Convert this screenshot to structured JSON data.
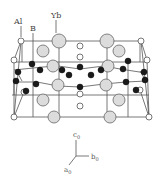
{
  "figure": {
    "labels": {
      "al": {
        "text": "Al",
        "x": 14,
        "y": 24
      },
      "b": {
        "text": "B",
        "x": 30,
        "y": 31
      },
      "yb": {
        "text": "Yb",
        "x": 51,
        "y": 18
      }
    },
    "leaders": [
      {
        "x1": 21,
        "y1": 26,
        "x2": 21,
        "y2": 37
      },
      {
        "x1": 33,
        "y1": 33,
        "x2": 33,
        "y2": 60
      },
      {
        "x1": 56,
        "y1": 20,
        "x2": 56,
        "y2": 33
      }
    ],
    "axes": {
      "origin": [
        76,
        156
      ],
      "c": {
        "label": "c",
        "sub": "0",
        "end": [
          76,
          140
        ],
        "lx": 73,
        "ly": 137
      },
      "b": {
        "label": "b",
        "sub": "0",
        "end": [
          89,
          156
        ],
        "lx": 91,
        "ly": 159
      },
      "a": {
        "label": "a",
        "sub": "0",
        "end": [
          69,
          165
        ],
        "lx": 64,
        "ly": 172
      }
    },
    "colors": {
      "line": "#555555",
      "yb_fill": "#dcdcdc",
      "yb_stroke": "#666666",
      "b_fill": "#1a1a1a",
      "al_fill": "#ffffff",
      "al_stroke": "#555555"
    }
  },
  "chart_data": {
    "type": "diagram",
    "legend": [
      "Al",
      "B",
      "Yb"
    ],
    "frame_lines": [
      [
        21,
        41,
        141,
        41
      ],
      [
        14,
        117,
        149,
        117
      ],
      [
        21,
        41,
        14,
        117
      ],
      [
        141,
        41,
        149,
        117
      ],
      [
        21,
        41,
        14,
        60
      ],
      [
        141,
        41,
        147,
        60
      ],
      [
        14,
        60,
        14,
        117
      ],
      [
        147,
        60,
        149,
        117
      ],
      [
        12,
        62,
        149,
        62
      ],
      [
        12,
        95,
        149,
        95
      ],
      [
        22,
        40,
        22,
        62
      ],
      [
        140,
        40,
        140,
        62
      ],
      [
        59,
        41,
        59,
        117
      ],
      [
        107,
        41,
        107,
        117
      ],
      [
        33,
        60,
        33,
        117
      ],
      [
        128,
        60,
        128,
        117
      ],
      [
        14,
        80,
        14,
        95
      ],
      [
        14,
        70,
        43,
        67
      ],
      [
        43,
        67,
        58,
        66
      ],
      [
        58,
        66,
        80,
        69
      ],
      [
        80,
        69,
        104,
        66
      ],
      [
        104,
        66,
        120,
        69
      ],
      [
        120,
        69,
        146,
        73
      ],
      [
        14,
        82,
        37,
        82
      ],
      [
        37,
        82,
        58,
        86
      ],
      [
        58,
        86,
        80,
        87
      ],
      [
        80,
        87,
        104,
        84
      ],
      [
        104,
        84,
        126,
        82
      ],
      [
        126,
        82,
        146,
        81
      ],
      [
        16,
        70,
        22,
        81
      ],
      [
        140,
        71,
        146,
        81
      ],
      [
        24,
        92,
        14,
        117
      ],
      [
        140,
        90,
        149,
        117
      ]
    ],
    "yb_atoms": [
      [
        59,
        41,
        7
      ],
      [
        107,
        41,
        7
      ],
      [
        43,
        51,
        6
      ],
      [
        119,
        51,
        6
      ],
      [
        53,
        66,
        6
      ],
      [
        108,
        66,
        6
      ],
      [
        58,
        85,
        6
      ],
      [
        106,
        85,
        6
      ],
      [
        43,
        100,
        6
      ],
      [
        119,
        100,
        6
      ],
      [
        54,
        117,
        6
      ],
      [
        110,
        117,
        6
      ]
    ],
    "b_atoms": [
      [
        32,
        64,
        3
      ],
      [
        40,
        70,
        3
      ],
      [
        18,
        72,
        3
      ],
      [
        62,
        70,
        3
      ],
      [
        69,
        75,
        3
      ],
      [
        80,
        67,
        3
      ],
      [
        91,
        75,
        3
      ],
      [
        101,
        70,
        3
      ],
      [
        123,
        69,
        3
      ],
      [
        128,
        61,
        3
      ],
      [
        144,
        72,
        3
      ],
      [
        16,
        81,
        3
      ],
      [
        36,
        84,
        3
      ],
      [
        26,
        91,
        3
      ],
      [
        80,
        87,
        3
      ],
      [
        126,
        82,
        3
      ],
      [
        145,
        80,
        3
      ],
      [
        136,
        90,
        3
      ]
    ],
    "al_atoms": [
      [
        21,
        41,
        3
      ],
      [
        141,
        41,
        3
      ],
      [
        14,
        117,
        3
      ],
      [
        149,
        117,
        3
      ],
      [
        14,
        60,
        3
      ],
      [
        147,
        60,
        3
      ],
      [
        80,
        46,
        3
      ],
      [
        80,
        57,
        3
      ],
      [
        80,
        94,
        3
      ],
      [
        80,
        106,
        3
      ],
      [
        24,
        92,
        3
      ],
      [
        140,
        90,
        3
      ]
    ]
  }
}
